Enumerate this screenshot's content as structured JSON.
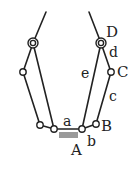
{
  "diagram": {
    "type": "linkage-mechanism",
    "colors": {
      "line": "#222222",
      "ground": "#9a9a9a",
      "background": "#ffffff"
    },
    "labels": {
      "A": "A",
      "B": "B",
      "C": "C",
      "D": "D",
      "a": "a",
      "b": "b",
      "c": "c",
      "d": "d",
      "e": "e"
    },
    "joints": [
      {
        "id": "left-top",
        "x": 33,
        "y": 43
      },
      {
        "id": "left-mid",
        "x": 23,
        "y": 72
      },
      {
        "id": "left-bottom-outer",
        "x": 40,
        "y": 125
      },
      {
        "id": "left-bottom-inner",
        "x": 54,
        "y": 129
      },
      {
        "id": "A",
        "x": 82,
        "y": 129
      },
      {
        "id": "B",
        "x": 96,
        "y": 124
      },
      {
        "id": "C",
        "x": 111,
        "y": 72
      },
      {
        "id": "D",
        "x": 101,
        "y": 43
      }
    ]
  }
}
